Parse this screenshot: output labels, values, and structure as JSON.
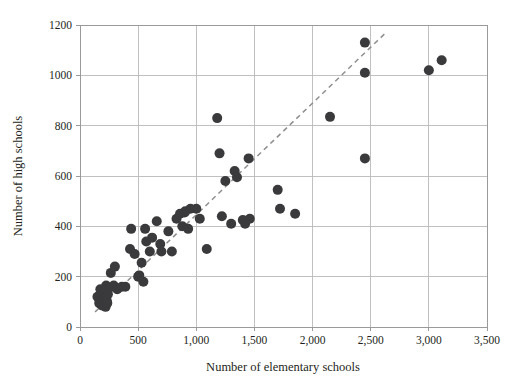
{
  "chart_data": {
    "type": "scatter",
    "title": "",
    "xlabel": "Number of elementary schools",
    "ylabel": "Number of high schools",
    "xlim": [
      0,
      3500
    ],
    "ylim": [
      0,
      1200
    ],
    "xticks": [
      0,
      500,
      1000,
      1500,
      2000,
      2500,
      3000,
      3500
    ],
    "xtick_labels": [
      "0",
      "500",
      "1,000",
      "1,500",
      "2,000",
      "2,500",
      "3,000",
      "3,500"
    ],
    "yticks": [
      0,
      200,
      400,
      600,
      800,
      1000,
      1200
    ],
    "ytick_labels": [
      "0",
      "200",
      "400",
      "600",
      "800",
      "1000",
      "1200"
    ],
    "grid": true,
    "legend": null,
    "marker_color": "#3a3a3c",
    "marker_size": 5,
    "points": [
      [
        150,
        120
      ],
      [
        165,
        95
      ],
      [
        175,
        150
      ],
      [
        180,
        90
      ],
      [
        190,
        110
      ],
      [
        195,
        85
      ],
      [
        200,
        100
      ],
      [
        205,
        135
      ],
      [
        210,
        90
      ],
      [
        215,
        115
      ],
      [
        220,
        80
      ],
      [
        225,
        165
      ],
      [
        230,
        105
      ],
      [
        235,
        95
      ],
      [
        240,
        130
      ],
      [
        250,
        155
      ],
      [
        265,
        215
      ],
      [
        290,
        165
      ],
      [
        300,
        240
      ],
      [
        320,
        150
      ],
      [
        360,
        160
      ],
      [
        390,
        160
      ],
      [
        430,
        310
      ],
      [
        440,
        390
      ],
      [
        470,
        290
      ],
      [
        500,
        200
      ],
      [
        510,
        205
      ],
      [
        530,
        255
      ],
      [
        545,
        180
      ],
      [
        560,
        390
      ],
      [
        570,
        340
      ],
      [
        600,
        300
      ],
      [
        620,
        355
      ],
      [
        660,
        420
      ],
      [
        690,
        330
      ],
      [
        700,
        300
      ],
      [
        760,
        380
      ],
      [
        790,
        300
      ],
      [
        830,
        430
      ],
      [
        860,
        450
      ],
      [
        880,
        400
      ],
      [
        900,
        455
      ],
      [
        905,
        460
      ],
      [
        930,
        390
      ],
      [
        950,
        470
      ],
      [
        1000,
        470
      ],
      [
        1030,
        430
      ],
      [
        1090,
        310
      ],
      [
        1180,
        830
      ],
      [
        1200,
        690
      ],
      [
        1220,
        440
      ],
      [
        1250,
        580
      ],
      [
        1300,
        410
      ],
      [
        1330,
        620
      ],
      [
        1350,
        595
      ],
      [
        1400,
        425
      ],
      [
        1420,
        410
      ],
      [
        1450,
        670
      ],
      [
        1460,
        430
      ],
      [
        1700,
        545
      ],
      [
        1720,
        470
      ],
      [
        1850,
        450
      ],
      [
        2150,
        835
      ],
      [
        2450,
        1130
      ],
      [
        2450,
        1010
      ],
      [
        2450,
        670
      ],
      [
        3000,
        1020
      ],
      [
        3110,
        1060
      ]
    ],
    "trendline": {
      "style": "dashed",
      "color": "#8e8e8e",
      "x0": 130,
      "y0": 60,
      "x1": 2620,
      "y1": 1165
    }
  }
}
